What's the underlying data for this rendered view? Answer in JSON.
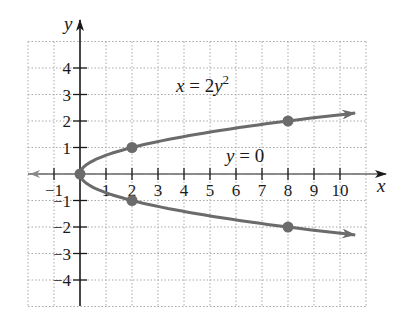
{
  "chart_data": {
    "type": "line",
    "title": "",
    "xlabel": "x",
    "ylabel": "y",
    "xlim": [
      -2,
      11
    ],
    "ylim": [
      -5,
      5
    ],
    "grid": true,
    "x_ticks": [
      -1,
      1,
      2,
      3,
      4,
      5,
      6,
      7,
      8,
      9,
      10
    ],
    "y_ticks": [
      -4,
      -3,
      -2,
      -1,
      1,
      2,
      3,
      4
    ],
    "x_tick_labels": [
      "−1",
      "1",
      "2",
      "3",
      "4",
      "5",
      "6",
      "7",
      "8",
      "9",
      "10"
    ],
    "y_tick_labels": [
      "4",
      "3",
      "2",
      "1",
      "−1",
      "−2",
      "−3",
      "−4"
    ],
    "series": [
      {
        "name": "x = 2y²",
        "style": "solid",
        "color": "#6b6b6b",
        "equation": "x = 2y^2",
        "points": [
          [
            8,
            2
          ],
          [
            2,
            1
          ],
          [
            0,
            0
          ],
          [
            2,
            -1
          ],
          [
            8,
            -2
          ]
        ]
      },
      {
        "name": "y = 0",
        "style": "dashed",
        "color": "#6b6b6b",
        "equation": "y = 0",
        "note": "axis of symmetry"
      }
    ],
    "annotations": [
      {
        "text": "x = 2y²",
        "x": 4,
        "y": 3
      },
      {
        "text": "y = 0",
        "x": 7,
        "y": 0.5
      }
    ]
  },
  "labels": {
    "x_axis": "x",
    "y_axis": "y",
    "eq_main_prefix": "x = 2y",
    "eq_main_exp": "2",
    "eq_axis": "y = 0"
  },
  "colors": {
    "curve": "#6b6b6b",
    "axis": "#1a1a1a",
    "grid": "#b0b0b0"
  }
}
